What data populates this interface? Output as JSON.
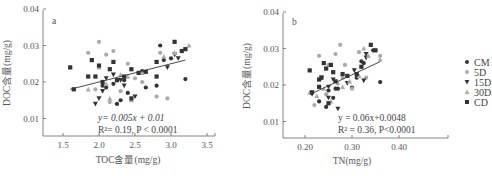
{
  "chart_data": [
    {
      "type": "scatter",
      "panel_label": "a",
      "title": "",
      "xlabel": "TOC含量(mg/g)",
      "ylabel": "DOC含量(mg/g)",
      "xlim": [
        1.3,
        3.6
      ],
      "ylim": [
        0.005,
        0.04
      ],
      "xticks": [
        "1.5",
        "2.0",
        "2.5",
        "3.0",
        "3.5"
      ],
      "yticks": [
        "0.01",
        "0.02",
        "0.03",
        "0.04"
      ],
      "grid": false,
      "regression": {
        "equation": "y= 0.005x + 0.01",
        "r2_text": "R²= 0.19, P < 0.0001",
        "slope": 0.005,
        "intercept": 0.01,
        "x_range": [
          1.6,
          3.2
        ]
      },
      "series": [
        {
          "name": "CM",
          "marker": "circle",
          "color": "#333333",
          "points": [
            [
              2.05,
              0.019
            ],
            [
              2.1,
              0.0185
            ],
            [
              2.25,
              0.014
            ],
            [
              2.3,
              0.015
            ],
            [
              2.4,
              0.017
            ],
            [
              2.6,
              0.023
            ],
            [
              2.65,
              0.0185
            ],
            [
              2.8,
              0.019
            ],
            [
              2.85,
              0.03
            ],
            [
              2.9,
              0.026
            ],
            [
              3.0,
              0.0265
            ],
            [
              3.2,
              0.0208
            ],
            [
              2.2,
              0.0195
            ],
            [
              2.35,
              0.0205
            ]
          ]
        },
        {
          "name": "5D",
          "marker": "circle",
          "color": "#aaaaaa",
          "points": [
            [
              1.85,
              0.028
            ],
            [
              2.0,
              0.031
            ],
            [
              2.1,
              0.0275
            ],
            [
              2.2,
              0.0285
            ],
            [
              2.4,
              0.025
            ],
            [
              2.5,
              0.021
            ],
            [
              2.6,
              0.02
            ],
            [
              2.8,
              0.016
            ],
            [
              2.95,
              0.0155
            ],
            [
              2.85,
              0.028
            ],
            [
              2.15,
              0.0145
            ],
            [
              2.3,
              0.0175
            ],
            [
              1.95,
              0.018
            ]
          ]
        },
        {
          "name": "15D",
          "marker": "triangle-down",
          "color": "#333333",
          "points": [
            [
              1.95,
              0.014
            ],
            [
              2.0,
              0.0155
            ],
            [
              2.05,
              0.0175
            ],
            [
              2.1,
              0.021
            ],
            [
              2.2,
              0.022
            ],
            [
              2.3,
              0.0205
            ],
            [
              2.5,
              0.016
            ],
            [
              2.95,
              0.024
            ],
            [
              3.05,
              0.0275
            ],
            [
              3.1,
              0.0265
            ],
            [
              2.35,
              0.019
            ]
          ]
        },
        {
          "name": "30D",
          "marker": "triangle-up",
          "color": "#aaaaaa",
          "points": [
            [
              1.85,
              0.018
            ],
            [
              2.0,
              0.024
            ],
            [
              2.15,
              0.0155
            ],
            [
              2.3,
              0.022
            ],
            [
              2.4,
              0.0215
            ],
            [
              2.45,
              0.015
            ],
            [
              2.6,
              0.0225
            ],
            [
              2.9,
              0.027
            ],
            [
              3.05,
              0.028
            ],
            [
              3.25,
              0.03
            ],
            [
              2.1,
              0.0195
            ]
          ]
        },
        {
          "name": "CD",
          "marker": "square",
          "color": "#333333",
          "points": [
            [
              1.6,
              0.024
            ],
            [
              1.65,
              0.018
            ],
            [
              1.85,
              0.0215
            ],
            [
              1.9,
              0.026
            ],
            [
              1.95,
              0.0215
            ],
            [
              2.0,
              0.0245
            ],
            [
              2.05,
              0.02
            ],
            [
              2.15,
              0.0235
            ],
            [
              2.2,
              0.0255
            ],
            [
              2.35,
              0.0215
            ],
            [
              2.45,
              0.0235
            ],
            [
              2.55,
              0.0225
            ],
            [
              2.65,
              0.0228
            ],
            [
              2.8,
              0.0215
            ],
            [
              2.8,
              0.0255
            ],
            [
              3.05,
              0.031
            ],
            [
              3.15,
              0.0285
            ],
            [
              3.2,
              0.029
            ],
            [
              2.45,
              0.0155
            ],
            [
              2.25,
              0.0205
            ]
          ]
        }
      ]
    },
    {
      "type": "scatter",
      "panel_label": "b",
      "title": "",
      "xlabel": "TN(mg/g)",
      "ylabel": "DOC含量(mg/g)",
      "xlim": [
        0.16,
        0.46
      ],
      "ylim": [
        0.005,
        0.04
      ],
      "xticks": [
        "0.20",
        "0.30",
        "0.40"
      ],
      "yticks": [
        "0.01",
        "0.02",
        "0.03",
        "0.04"
      ],
      "grid": false,
      "regression": {
        "equation": "y = 0.06x+0.0048",
        "r2_text": "R² = 0.36, P<0.0001",
        "slope": 0.06,
        "intercept": 0.0048,
        "x_range": [
          0.21,
          0.36
        ]
      },
      "series": [
        {
          "name": "CM",
          "marker": "circle",
          "color": "#333333",
          "points": [
            [
              0.23,
              0.0155
            ],
            [
              0.245,
              0.014
            ],
            [
              0.25,
              0.0185
            ],
            [
              0.26,
              0.0165
            ],
            [
              0.265,
              0.019
            ],
            [
              0.27,
              0.019
            ],
            [
              0.3,
              0.0193
            ],
            [
              0.31,
              0.022
            ],
            [
              0.32,
              0.0265
            ],
            [
              0.345,
              0.0295
            ],
            [
              0.36,
              0.0208
            ],
            [
              0.325,
              0.026
            ]
          ]
        },
        {
          "name": "5D",
          "marker": "circle",
          "color": "#aaaaaa",
          "points": [
            [
              0.22,
              0.0145
            ],
            [
              0.23,
              0.028
            ],
            [
              0.25,
              0.0255
            ],
            [
              0.265,
              0.0285
            ],
            [
              0.275,
              0.031
            ],
            [
              0.285,
              0.0255
            ],
            [
              0.3,
              0.019
            ],
            [
              0.315,
              0.029
            ],
            [
              0.33,
              0.022
            ],
            [
              0.36,
              0.028
            ],
            [
              0.245,
              0.0175
            ],
            [
              0.28,
              0.022
            ]
          ]
        },
        {
          "name": "15D",
          "marker": "triangle-down",
          "color": "#333333",
          "points": [
            [
              0.215,
              0.0175
            ],
            [
              0.235,
              0.022
            ],
            [
              0.25,
              0.0165
            ],
            [
              0.26,
              0.0215
            ],
            [
              0.27,
              0.0135
            ],
            [
              0.29,
              0.0205
            ],
            [
              0.305,
              0.024
            ],
            [
              0.33,
              0.0275
            ],
            [
              0.33,
              0.0285
            ],
            [
              0.325,
              0.0212
            ],
            [
              0.25,
              0.0195
            ]
          ]
        },
        {
          "name": "30D",
          "marker": "triangle-up",
          "color": "#aaaaaa",
          "points": [
            [
              0.21,
              0.018
            ],
            [
              0.225,
              0.017
            ],
            [
              0.24,
              0.019
            ],
            [
              0.255,
              0.0155
            ],
            [
              0.28,
              0.0195
            ],
            [
              0.295,
              0.021
            ],
            [
              0.315,
              0.0225
            ],
            [
              0.325,
              0.03
            ],
            [
              0.335,
              0.028
            ],
            [
              0.36,
              0.027
            ],
            [
              0.27,
              0.0205
            ]
          ]
        },
        {
          "name": "CD",
          "marker": "square",
          "color": "#333333",
          "points": [
            [
              0.21,
              0.024
            ],
            [
              0.215,
              0.018
            ],
            [
              0.23,
              0.0195
            ],
            [
              0.23,
              0.0215
            ],
            [
              0.235,
              0.022
            ],
            [
              0.24,
              0.026
            ],
            [
              0.245,
              0.0245
            ],
            [
              0.255,
              0.0255
            ],
            [
              0.26,
              0.0235
            ],
            [
              0.265,
              0.021
            ],
            [
              0.28,
              0.023
            ],
            [
              0.31,
              0.023
            ],
            [
              0.32,
              0.025
            ],
            [
              0.34,
              0.031
            ],
            [
              0.35,
              0.0295
            ],
            [
              0.25,
              0.015
            ],
            [
              0.29,
              0.0225
            ]
          ]
        }
      ]
    }
  ],
  "legend": {
    "items": [
      {
        "label": "CM",
        "marker": "circle",
        "color": "#333333"
      },
      {
        "label": "5D",
        "marker": "circle",
        "color": "#aaaaaa"
      },
      {
        "label": "15D",
        "marker": "triangle-down",
        "color": "#333333"
      },
      {
        "label": "30D",
        "marker": "triangle-up",
        "color": "#aaaaaa"
      },
      {
        "label": "CD",
        "marker": "square",
        "color": "#333333"
      }
    ]
  },
  "panels": {
    "a": {
      "label": "a",
      "xlabel": "TOC含量(mg/g)",
      "ylabel": "DOC含量(mg/g)",
      "eq1": "y= 0.005x + 0.01",
      "eq2": "R²= 0.19, P < 0.0001"
    },
    "b": {
      "label": "b",
      "xlabel": "TN(mg/g)",
      "ylabel": "DOC含量(mg/g)",
      "eq1": "y = 0.06x+0.0048",
      "eq2": "R² = 0.36, P<0.0001"
    }
  }
}
